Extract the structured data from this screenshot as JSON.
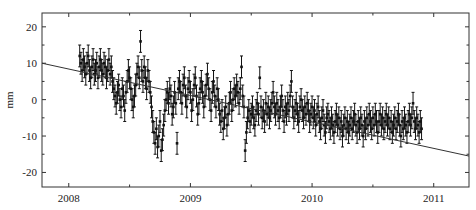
{
  "chart_data": {
    "type": "scatter",
    "title": "",
    "xlabel": "",
    "ylabel": "mm",
    "xlim": [
      2007.78,
      2011.29
    ],
    "ylim": [
      -24,
      23.8
    ],
    "xticks": [
      2008,
      2009,
      2010,
      2011
    ],
    "xtick_labels": [
      "2008",
      "2009",
      "2010",
      "2011"
    ],
    "yticks": [
      20,
      10,
      0,
      -10,
      -20
    ],
    "ytick_labels": [
      "20",
      "10",
      "0",
      "-10",
      "-20"
    ],
    "grid": false,
    "legend": null,
    "trend_line": {
      "x": [
        2007.78,
        2011.29
      ],
      "y": [
        10.0,
        -15.5
      ]
    },
    "error_bar_half_width_mm": 3,
    "series": [
      {
        "name": "daily position (mm) with error bars",
        "points": [
          [
            2008.09,
            12
          ],
          [
            2008.1,
            10
          ],
          [
            2008.11,
            8
          ],
          [
            2008.12,
            11
          ],
          [
            2008.13,
            9
          ],
          [
            2008.14,
            7
          ],
          [
            2008.15,
            10
          ],
          [
            2008.16,
            12
          ],
          [
            2008.17,
            8
          ],
          [
            2008.18,
            6
          ],
          [
            2008.19,
            9
          ],
          [
            2008.2,
            11
          ],
          [
            2008.21,
            7
          ],
          [
            2008.22,
            8
          ],
          [
            2008.23,
            10
          ],
          [
            2008.24,
            6
          ],
          [
            2008.25,
            9
          ],
          [
            2008.26,
            11
          ],
          [
            2008.27,
            8
          ],
          [
            2008.28,
            7
          ],
          [
            2008.29,
            10
          ],
          [
            2008.3,
            9
          ],
          [
            2008.31,
            6
          ],
          [
            2008.32,
            8
          ],
          [
            2008.33,
            11
          ],
          [
            2008.34,
            7
          ],
          [
            2008.35,
            9
          ],
          [
            2008.36,
            5
          ],
          [
            2008.37,
            3
          ],
          [
            2008.38,
            1
          ],
          [
            2008.39,
            -1
          ],
          [
            2008.4,
            2
          ],
          [
            2008.41,
            4
          ],
          [
            2008.42,
            0
          ],
          [
            2008.43,
            -2
          ],
          [
            2008.44,
            3
          ],
          [
            2008.45,
            1
          ],
          [
            2008.46,
            -3
          ],
          [
            2008.47,
            2
          ],
          [
            2008.48,
            5
          ],
          [
            2008.49,
            8
          ],
          [
            2008.5,
            6
          ],
          [
            2008.51,
            3
          ],
          [
            2008.52,
            0
          ],
          [
            2008.53,
            -2
          ],
          [
            2008.54,
            1
          ],
          [
            2008.55,
            4
          ],
          [
            2008.56,
            7
          ],
          [
            2008.57,
            9
          ],
          [
            2008.58,
            6
          ],
          [
            2008.59,
            16
          ],
          [
            2008.6,
            8
          ],
          [
            2008.61,
            5
          ],
          [
            2008.62,
            9
          ],
          [
            2008.63,
            6
          ],
          [
            2008.64,
            3
          ],
          [
            2008.65,
            8
          ],
          [
            2008.66,
            5
          ],
          [
            2008.67,
            2
          ],
          [
            2008.68,
            -2
          ],
          [
            2008.69,
            -6
          ],
          [
            2008.7,
            -9
          ],
          [
            2008.71,
            -12
          ],
          [
            2008.72,
            -8
          ],
          [
            2008.73,
            -13
          ],
          [
            2008.74,
            -10
          ],
          [
            2008.75,
            -6
          ],
          [
            2008.76,
            -14
          ],
          [
            2008.77,
            -11
          ],
          [
            2008.78,
            -7
          ],
          [
            2008.79,
            -3
          ],
          [
            2008.8,
            0
          ],
          [
            2008.81,
            2
          ],
          [
            2008.82,
            -1
          ],
          [
            2008.83,
            3
          ],
          [
            2008.84,
            1
          ],
          [
            2008.85,
            -4
          ],
          [
            2008.86,
            -2
          ],
          [
            2008.87,
            2
          ],
          [
            2008.88,
            -1
          ],
          [
            2008.89,
            -12
          ],
          [
            2008.9,
            3
          ],
          [
            2008.91,
            5
          ],
          [
            2008.92,
            2
          ],
          [
            2008.93,
            -1
          ],
          [
            2008.94,
            4
          ],
          [
            2008.95,
            6
          ],
          [
            2008.96,
            1
          ],
          [
            2008.97,
            -2
          ],
          [
            2008.98,
            3
          ],
          [
            2008.99,
            5
          ],
          [
            2009.0,
            2
          ],
          [
            2009.01,
            -3
          ],
          [
            2009.02,
            0
          ],
          [
            2009.03,
            4
          ],
          [
            2009.04,
            6
          ],
          [
            2009.05,
            1
          ],
          [
            2009.06,
            -4
          ],
          [
            2009.07,
            -1
          ],
          [
            2009.08,
            3
          ],
          [
            2009.09,
            5
          ],
          [
            2009.1,
            2
          ],
          [
            2009.11,
            -2
          ],
          [
            2009.12,
            1
          ],
          [
            2009.13,
            4
          ],
          [
            2009.14,
            7
          ],
          [
            2009.15,
            3
          ],
          [
            2009.16,
            0
          ],
          [
            2009.17,
            -3
          ],
          [
            2009.18,
            2
          ],
          [
            2009.19,
            5
          ],
          [
            2009.2,
            1
          ],
          [
            2009.21,
            -2
          ],
          [
            2009.22,
            3
          ],
          [
            2009.23,
            0
          ],
          [
            2009.24,
            -4
          ],
          [
            2009.25,
            -6
          ],
          [
            2009.26,
            -3
          ],
          [
            2009.27,
            -8
          ],
          [
            2009.28,
            -5
          ],
          [
            2009.29,
            -2
          ],
          [
            2009.3,
            -7
          ],
          [
            2009.31,
            -4
          ],
          [
            2009.32,
            -1
          ],
          [
            2009.33,
            2
          ],
          [
            2009.34,
            -3
          ],
          [
            2009.35,
            0
          ],
          [
            2009.36,
            3
          ],
          [
            2009.37,
            1
          ],
          [
            2009.38,
            4
          ],
          [
            2009.39,
            2
          ],
          [
            2009.4,
            -1
          ],
          [
            2009.41,
            3
          ],
          [
            2009.42,
            9
          ],
          [
            2009.43,
            1
          ],
          [
            2009.44,
            -2
          ],
          [
            2009.45,
            -14
          ],
          [
            2009.46,
            -9
          ],
          [
            2009.47,
            -5
          ],
          [
            2009.48,
            -3
          ],
          [
            2009.49,
            -6
          ],
          [
            2009.5,
            -4
          ],
          [
            2009.51,
            -2
          ],
          [
            2009.52,
            -5
          ],
          [
            2009.53,
            -7
          ],
          [
            2009.54,
            -3
          ],
          [
            2009.55,
            -1
          ],
          [
            2009.56,
            -4
          ],
          [
            2009.57,
            6
          ],
          [
            2009.58,
            -2
          ],
          [
            2009.59,
            -5
          ],
          [
            2009.6,
            -3
          ],
          [
            2009.61,
            -6
          ],
          [
            2009.62,
            -1
          ],
          [
            2009.63,
            -4
          ],
          [
            2009.64,
            -2
          ],
          [
            2009.65,
            -5
          ],
          [
            2009.66,
            -3
          ],
          [
            2009.67,
            -1
          ],
          [
            2009.68,
            2
          ],
          [
            2009.69,
            -2
          ],
          [
            2009.7,
            -4
          ],
          [
            2009.71,
            -1
          ],
          [
            2009.72,
            -3
          ],
          [
            2009.73,
            -5
          ],
          [
            2009.74,
            -2
          ],
          [
            2009.75,
            1
          ],
          [
            2009.76,
            -3
          ],
          [
            2009.77,
            -6
          ],
          [
            2009.78,
            -2
          ],
          [
            2009.79,
            -4
          ],
          [
            2009.8,
            -1
          ],
          [
            2009.81,
            -3
          ],
          [
            2009.82,
            1
          ],
          [
            2009.83,
            5
          ],
          [
            2009.84,
            -2
          ],
          [
            2009.85,
            -5
          ],
          [
            2009.86,
            -3
          ],
          [
            2009.87,
            -1
          ],
          [
            2009.88,
            -4
          ],
          [
            2009.89,
            -6
          ],
          [
            2009.9,
            -2
          ],
          [
            2009.91,
            0
          ],
          [
            2009.92,
            -3
          ],
          [
            2009.93,
            -5
          ],
          [
            2009.94,
            -2
          ],
          [
            2009.95,
            -4
          ],
          [
            2009.96,
            -1
          ],
          [
            2009.97,
            -3
          ],
          [
            2009.98,
            -6
          ],
          [
            2009.99,
            -4
          ],
          [
            2010.0,
            -2
          ],
          [
            2010.01,
            -5
          ],
          [
            2010.02,
            -3
          ],
          [
            2010.03,
            -7
          ],
          [
            2010.04,
            -4
          ],
          [
            2010.05,
            -2
          ],
          [
            2010.06,
            -6
          ],
          [
            2010.07,
            -8
          ],
          [
            2010.08,
            -5
          ],
          [
            2010.09,
            -3
          ],
          [
            2010.1,
            -7
          ],
          [
            2010.11,
            -9
          ],
          [
            2010.12,
            -5
          ],
          [
            2010.13,
            -4
          ],
          [
            2010.14,
            -6
          ],
          [
            2010.15,
            -8
          ],
          [
            2010.16,
            -5
          ],
          [
            2010.17,
            -7
          ],
          [
            2010.18,
            -9
          ],
          [
            2010.19,
            -6
          ],
          [
            2010.2,
            -4
          ],
          [
            2010.21,
            -7
          ],
          [
            2010.22,
            -5
          ],
          [
            2010.23,
            -8
          ],
          [
            2010.24,
            -6
          ],
          [
            2010.25,
            -10
          ],
          [
            2010.26,
            -7
          ],
          [
            2010.27,
            -5
          ],
          [
            2010.28,
            -8
          ],
          [
            2010.29,
            -6
          ],
          [
            2010.3,
            -9
          ],
          [
            2010.31,
            -7
          ],
          [
            2010.32,
            -5
          ],
          [
            2010.33,
            -8
          ],
          [
            2010.34,
            -6
          ],
          [
            2010.35,
            -4
          ],
          [
            2010.36,
            -7
          ],
          [
            2010.37,
            -9
          ],
          [
            2010.38,
            -6
          ],
          [
            2010.39,
            -8
          ],
          [
            2010.4,
            -5
          ],
          [
            2010.41,
            -7
          ],
          [
            2010.42,
            -10
          ],
          [
            2010.43,
            -6
          ],
          [
            2010.44,
            -8
          ],
          [
            2010.45,
            -5
          ],
          [
            2010.46,
            -7
          ],
          [
            2010.47,
            -4
          ],
          [
            2010.48,
            -6
          ],
          [
            2010.49,
            -8
          ],
          [
            2010.5,
            -5
          ],
          [
            2010.51,
            -7
          ],
          [
            2010.52,
            -4
          ],
          [
            2010.53,
            -6
          ],
          [
            2010.54,
            -9
          ],
          [
            2010.55,
            -6
          ],
          [
            2010.56,
            -4
          ],
          [
            2010.57,
            -7
          ],
          [
            2010.58,
            -5
          ],
          [
            2010.59,
            -8
          ],
          [
            2010.6,
            -6
          ],
          [
            2010.61,
            -4
          ],
          [
            2010.62,
            -7
          ],
          [
            2010.63,
            -5
          ],
          [
            2010.64,
            -8
          ],
          [
            2010.65,
            -6
          ],
          [
            2010.66,
            -9
          ],
          [
            2010.67,
            -7
          ],
          [
            2010.68,
            -5
          ],
          [
            2010.69,
            -8
          ],
          [
            2010.7,
            -6
          ],
          [
            2010.71,
            -4
          ],
          [
            2010.72,
            -7
          ],
          [
            2010.73,
            -10
          ],
          [
            2010.74,
            -6
          ],
          [
            2010.75,
            -8
          ],
          [
            2010.76,
            -5
          ],
          [
            2010.77,
            -7
          ],
          [
            2010.78,
            -9
          ],
          [
            2010.79,
            -6
          ],
          [
            2010.8,
            -4
          ],
          [
            2010.81,
            -7
          ],
          [
            2010.82,
            -5
          ],
          [
            2010.83,
            -1
          ],
          [
            2010.84,
            -6
          ],
          [
            2010.85,
            -8
          ],
          [
            2010.86,
            -5
          ],
          [
            2010.87,
            -7
          ],
          [
            2010.88,
            -9
          ],
          [
            2010.89,
            -6
          ],
          [
            2010.9,
            -8
          ]
        ]
      }
    ],
    "colors": {
      "marker": "#111111",
      "trend": "#333333",
      "axis": "#333333",
      "background": "#ffffff"
    }
  },
  "layout": {
    "plot_left": 42,
    "plot_right": 469,
    "plot_top": 13,
    "plot_bottom": 187
  }
}
